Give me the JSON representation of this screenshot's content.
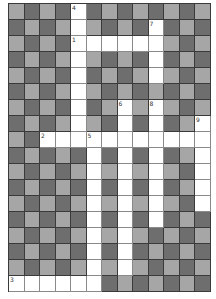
{
  "puzzle": {
    "type": "crossword",
    "cols": 13,
    "rows": 18,
    "colors": {
      "light": "#a6a6a6",
      "dark": "#6e6e6e",
      "white": "#ffffff",
      "border": "#3a3a3a"
    },
    "grid": [
      "LDLDWDLDLDLDL",
      "DLDLWLDLDWDLD",
      "LDLDWWWWWWLDL",
      "DLDLWLDLDWDLD",
      "LDLDWDLDLWLDL",
      "DLDLWLDLDLDLD",
      "LDLDWDLWLWLDL",
      "DLDLWLDWDWDLW",
      "LDWWWWWWWWWWW",
      "DLDLDWDWDWDLW",
      "LDLDLWLWLWLDW",
      "DLDLDWDWDWDLW",
      "LDLDLWLWLWLDW",
      "DLDLDWDWDWDLD",
      "LDLDLWLWLDLDL",
      "DLDLDWDWDLDLD",
      "LDLDLWLWLDLDL",
      "WWWWWWDLDLDLD"
    ],
    "numbers": [
      {
        "row": 0,
        "col": 4,
        "label": "4"
      },
      {
        "row": 1,
        "col": 9,
        "label": "7"
      },
      {
        "row": 2,
        "col": 4,
        "label": "1"
      },
      {
        "row": 6,
        "col": 7,
        "label": "6"
      },
      {
        "row": 6,
        "col": 9,
        "label": "8"
      },
      {
        "row": 7,
        "col": 12,
        "label": "9"
      },
      {
        "row": 8,
        "col": 2,
        "label": "2"
      },
      {
        "row": 8,
        "col": 5,
        "label": "5"
      },
      {
        "row": 17,
        "col": 0,
        "label": "3"
      }
    ]
  }
}
